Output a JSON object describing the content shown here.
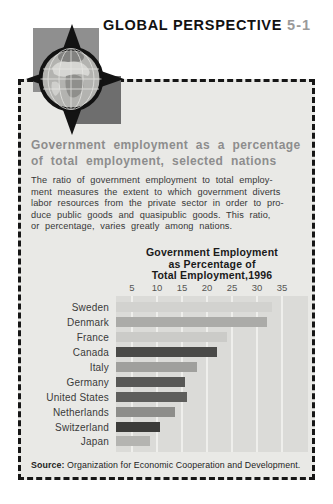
{
  "header": {
    "title": "GLOBAL PERSPECTIVE",
    "number": "5-1"
  },
  "panel": {
    "heading_lines": [
      "Government employment as a percentage",
      "of total employment, selected nations"
    ],
    "body_lines": [
      "The ratio of government employment to total employ-",
      "ment measures the extent to which government diverts",
      "labor resources from the private sector in order to pro-",
      "duce public goods and quasipublic goods. This ratio,",
      "or percentage, varies greatly among nations."
    ],
    "source_label": "Source:",
    "source_text": " Organization for Economic Cooperation and Development."
  },
  "icons": {
    "globe": "globe-icon",
    "arrow_up": "arrow-up-icon",
    "arrow_down": "arrow-down-icon",
    "arrow_left": "arrow-left-icon",
    "arrow_right": "arrow-right-icon"
  },
  "chart_data": {
    "type": "bar",
    "orientation": "horizontal",
    "title": "Government Employment as Percentage of Total Employment,1996",
    "title_lines": [
      "Government Employment",
      "as Percentage of",
      "Total Employment,1996"
    ],
    "categories": [
      "Sweden",
      "Denmark",
      "France",
      "Canada",
      "Italy",
      "Germany",
      "United States",
      "Netherlands",
      "Switzerland",
      "Japan"
    ],
    "values": [
      33,
      32,
      24,
      22,
      18,
      15.5,
      16,
      13.5,
      10.5,
      8.5
    ],
    "bar_colors": [
      "#d2d2cf",
      "#ababa8",
      "#cbcbc8",
      "#4a4a48",
      "#a0a09d",
      "#585856",
      "#5e5e5c",
      "#8d8d8a",
      "#3c3c3a",
      "#b4b4b1"
    ],
    "x_ticks": [
      5,
      10,
      15,
      20,
      25,
      30,
      35
    ],
    "xlim": [
      1.8,
      40.2
    ],
    "grid": true,
    "legend": false,
    "xlabel": "",
    "ylabel": "",
    "source": "Organization for Economic Cooperation and Development."
  },
  "colors": {
    "page_bg": "#ffffff",
    "panel_bg": "#e9e9e6",
    "border": "#161616",
    "figure_number": "#9a9a9a",
    "heading_text": "#8d8d8d",
    "body_text": "#373737",
    "plot_bg": "#dbdbd8",
    "gridline": "#efefec",
    "tick_text": "#555553",
    "square_light": "#8f8f8f",
    "square_dark": "#6e6e6e"
  }
}
